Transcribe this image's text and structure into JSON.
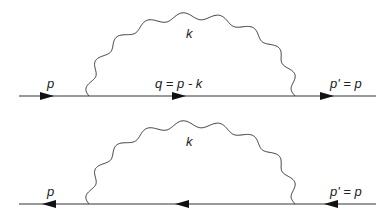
{
  "diagrams": [
    {
      "name": "electron-self-energy",
      "fermion_direction": "right",
      "labels": {
        "incoming": "p",
        "internal": "q = p - k",
        "photon": "k",
        "outgoing": "p' = p"
      }
    },
    {
      "name": "positron-self-energy",
      "fermion_direction": "left",
      "labels": {
        "incoming": "p",
        "photon": "k",
        "outgoing": "p' = p"
      }
    }
  ],
  "colors": {
    "line": "#333333",
    "text": "#222222",
    "background": "#ffffff"
  }
}
